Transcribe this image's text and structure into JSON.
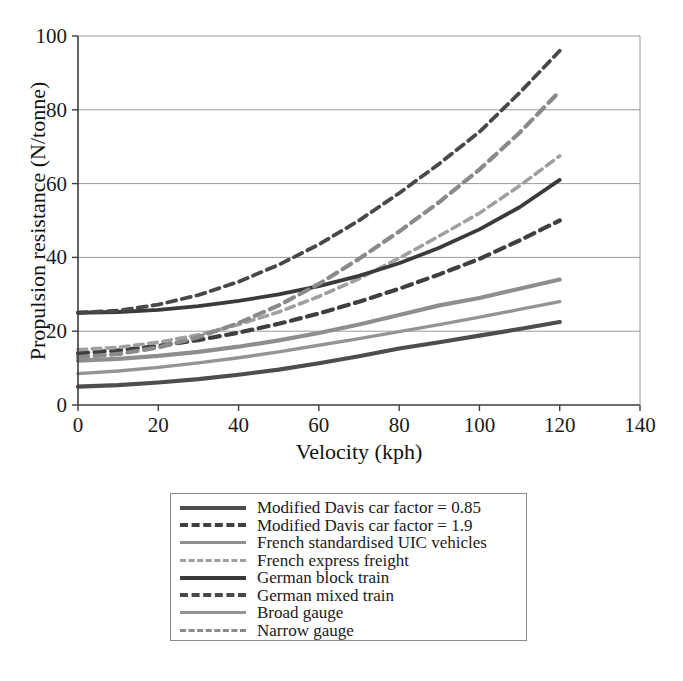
{
  "chart_data": {
    "type": "line",
    "title": "",
    "xlabel": "Velocity (kph)",
    "ylabel": "Propulsion resistance (N/tonne)",
    "xlim": [
      0,
      140
    ],
    "ylim": [
      0,
      100
    ],
    "xticks": [
      0,
      20,
      40,
      60,
      80,
      100,
      120,
      140
    ],
    "yticks": [
      0,
      20,
      40,
      60,
      80,
      100
    ],
    "grid": "horizontal",
    "legend_position": "below-plot",
    "x": [
      0,
      10,
      20,
      30,
      40,
      50,
      60,
      70,
      80,
      90,
      100,
      110,
      120
    ],
    "series": [
      {
        "name": "Modified Davis car factor = 0.85",
        "color": "#4d4d4d",
        "style": "solid",
        "width": 4.2,
        "values": [
          5.0,
          5.4,
          6.1,
          7.0,
          8.2,
          9.6,
          11.3,
          13.2,
          15.3,
          17.0,
          18.8,
          20.6,
          22.5
        ]
      },
      {
        "name": "Modified Davis car factor = 1.9",
        "color": "#3f3f3f",
        "style": "dashed",
        "width": 4.2,
        "values": [
          14.0,
          14.8,
          16.0,
          17.6,
          19.6,
          22.0,
          24.8,
          28.0,
          31.5,
          35.4,
          39.6,
          44.6,
          50.0
        ]
      },
      {
        "name": "French standardised UIC vehicles",
        "color": "#8e8e8e",
        "style": "solid",
        "width": 4.2,
        "values": [
          12.0,
          12.5,
          13.3,
          14.4,
          15.8,
          17.5,
          19.5,
          21.8,
          24.4,
          27.0,
          29.0,
          31.5,
          34.0
        ]
      },
      {
        "name": "French express freight",
        "color": "#a0a0a0",
        "style": "dashed",
        "width": 3.6,
        "values": [
          15.0,
          15.6,
          17.0,
          19.0,
          21.8,
          25.2,
          29.4,
          34.2,
          39.8,
          45.8,
          52.0,
          59.4,
          67.5
        ]
      },
      {
        "name": "German block train",
        "color": "#3a3a3a",
        "style": "solid",
        "width": 3.8,
        "values": [
          25.0,
          25.2,
          25.8,
          26.8,
          28.2,
          30.0,
          32.2,
          35.0,
          38.4,
          42.6,
          47.6,
          53.6,
          61.0
        ]
      },
      {
        "name": "German mixed train",
        "color": "#484848",
        "style": "dashed",
        "width": 3.8,
        "values": [
          25.0,
          25.6,
          27.2,
          29.8,
          33.4,
          38.0,
          43.5,
          50.0,
          57.4,
          65.4,
          74.0,
          84.6,
          96.0
        ]
      },
      {
        "name": "Broad gauge",
        "color": "#949494",
        "style": "solid",
        "width": 3.4,
        "values": [
          8.5,
          9.2,
          10.2,
          11.4,
          12.8,
          14.4,
          16.2,
          18.0,
          19.9,
          21.8,
          23.8,
          25.9,
          28.0
        ]
      },
      {
        "name": "Narrow gauge",
        "color": "#8a8a8a",
        "style": "dashed",
        "width": 4.2,
        "values": [
          13.0,
          13.8,
          15.6,
          18.4,
          22.2,
          27.0,
          32.8,
          39.6,
          47.0,
          55.0,
          63.8,
          73.8,
          85.0
        ]
      }
    ]
  },
  "axes": {
    "x_title": "Velocity (kph)",
    "y_title": "Propulsion resistance (N/tonne)",
    "x_tick_labels": [
      "0",
      "20",
      "40",
      "60",
      "80",
      "100",
      "120",
      "140"
    ],
    "y_tick_labels": [
      "0",
      "20",
      "40",
      "60",
      "80",
      "100"
    ]
  },
  "legend": {
    "items": [
      {
        "label": "Modified Davis car factor = 0.85",
        "color": "#4d4d4d",
        "style": "solid",
        "width": 4.5
      },
      {
        "label": "Modified Davis car factor = 1.9",
        "color": "#3f3f3f",
        "style": "dashed",
        "width": 4.5
      },
      {
        "label": "French standardised UIC vehicles",
        "color": "#8e8e8e",
        "style": "solid",
        "width": 3.6
      },
      {
        "label": "French express freight",
        "color": "#a0a0a0",
        "style": "dashed",
        "width": 3.8
      },
      {
        "label": "German block train",
        "color": "#3a3a3a",
        "style": "solid",
        "width": 4.8
      },
      {
        "label": "German mixed train",
        "color": "#484848",
        "style": "dashed",
        "width": 4.2
      },
      {
        "label": "Broad gauge",
        "color": "#949494",
        "style": "solid",
        "width": 3.2
      },
      {
        "label": "Narrow gauge",
        "color": "#8a8a8a",
        "style": "dashed",
        "width": 3.4
      }
    ]
  }
}
